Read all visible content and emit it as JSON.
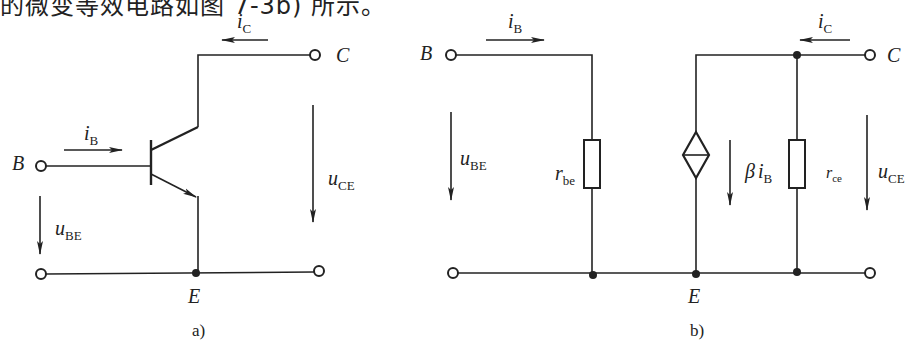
{
  "header_text": "的微变等效电路如图 7-3b) 所示。",
  "figure_a": {
    "caption": "a)",
    "terminals": {
      "B": "B",
      "C": "C",
      "E": "E"
    },
    "labels": {
      "iB": {
        "main": "i",
        "sub": "B"
      },
      "iC": {
        "main": "i",
        "sub": "C"
      },
      "uBE": {
        "main": "u",
        "sub": "BE"
      },
      "uCE": {
        "main": "u",
        "sub": "CE"
      }
    },
    "component": "npn-transistor"
  },
  "figure_b": {
    "caption": "b)",
    "terminals": {
      "B": "B",
      "C": "C",
      "E": "E"
    },
    "labels": {
      "iB": {
        "main": "i",
        "sub": "B"
      },
      "iC": {
        "main": "i",
        "sub": "C"
      },
      "uBE": {
        "main": "u",
        "sub": "BE"
      },
      "uCE": {
        "main": "u",
        "sub": "CE"
      },
      "rbe": {
        "main": "r",
        "sub": "be"
      },
      "rce": {
        "main": "r",
        "sub": "ce"
      },
      "source": {
        "beta": "β",
        "main": "i",
        "sub": "B"
      }
    },
    "components": [
      "resistor-rbe",
      "dependent-current-source",
      "resistor-rce"
    ]
  }
}
